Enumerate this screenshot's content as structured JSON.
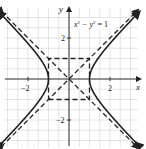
{
  "chart_data": {
    "type": "line",
    "title": "",
    "equation_label": "x² − y² = 1",
    "xlabel": "x",
    "ylabel": "y",
    "xlim": [
      -3.3,
      3.4
    ],
    "ylim": [
      -3.4,
      3.3
    ],
    "xticks": [
      -2,
      2
    ],
    "yticks": [
      2,
      -2
    ],
    "xtick_labels": [
      "−2",
      "2"
    ],
    "ytick_labels": [
      "2",
      "−2"
    ],
    "grid": true,
    "grid_step": 0.5,
    "series": [
      {
        "name": "hyperbola right branch",
        "style": "solid",
        "equation": "x = sqrt(1 + y^2)",
        "y_range": [
          -3.2,
          3.2
        ]
      },
      {
        "name": "hyperbola left branch",
        "style": "solid",
        "equation": "x = -sqrt(1 + y^2)",
        "y_range": [
          -3.2,
          3.2
        ]
      },
      {
        "name": "asymptote y = x",
        "style": "dashed",
        "points": [
          [
            -3.3,
            -3.3
          ],
          [
            3.3,
            3.3
          ]
        ]
      },
      {
        "name": "asymptote y = -x",
        "style": "dashed",
        "points": [
          [
            -3.3,
            3.3
          ],
          [
            3.3,
            -3.3
          ]
        ]
      },
      {
        "name": "central rectangle",
        "style": "dashed",
        "points": [
          [
            -1,
            -1
          ],
          [
            1,
            -1
          ],
          [
            1,
            1
          ],
          [
            -1,
            1
          ],
          [
            -1,
            -1
          ]
        ]
      }
    ],
    "vertices": [
      [
        -1,
        0
      ],
      [
        1,
        0
      ]
    ]
  },
  "labels": {
    "x_axis": "x",
    "y_axis": "y",
    "tick_x_neg2": "−2",
    "tick_x_2": "2",
    "tick_y_2": "2",
    "tick_y_neg2": "−2",
    "eq_x": "x",
    "eq_sup1": "2",
    "eq_mid": " − y",
    "eq_sup2": "2",
    "eq_end": " = 1"
  }
}
